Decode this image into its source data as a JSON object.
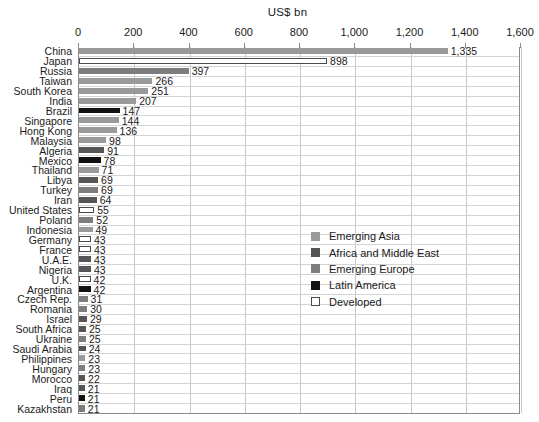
{
  "chart_data": {
    "type": "bar",
    "orientation": "horizontal",
    "title": "US$ bn",
    "xlabel": "US$ bn",
    "ylabel": "",
    "xlim": [
      0,
      1600
    ],
    "xticks": [
      0,
      200,
      400,
      600,
      800,
      1000,
      1200,
      1400,
      1600
    ],
    "xtick_labels": [
      "0",
      "200",
      "400",
      "600",
      "800",
      "1,000",
      "1,200",
      "1,400",
      "1,600"
    ],
    "grid": true,
    "legend_position": "center-right",
    "categories": [
      "China",
      "Japan",
      "Russia",
      "Taiwan",
      "South Korea",
      "India",
      "Brazil",
      "Singapore",
      "Hong Kong",
      "Malaysia",
      "Algeria",
      "Mexico",
      "Thailand",
      "Libya",
      "Turkey",
      "Iran",
      "United States",
      "Poland",
      "Indonesia",
      "Germany",
      "France",
      "U.A.E.",
      "Nigeria",
      "U.K.",
      "Argentina",
      "Czech Rep.",
      "Romania",
      "Israel",
      "South Africa",
      "Ukraine",
      "Saudi Arabia",
      "Philippines",
      "Hungary",
      "Morocco",
      "Iraq",
      "Peru",
      "Kazakhstan"
    ],
    "values": [
      1335,
      898,
      397,
      266,
      251,
      207,
      147,
      144,
      136,
      98,
      91,
      78,
      71,
      69,
      69,
      64,
      55,
      52,
      49,
      43,
      43,
      43,
      43,
      42,
      42,
      31,
      30,
      29,
      25,
      25,
      24,
      23,
      23,
      22,
      21,
      21,
      21
    ],
    "value_labels": [
      "1,335",
      "898",
      "397",
      "266",
      "251",
      "207",
      "147",
      "144",
      "136",
      "98",
      "91",
      "78",
      "71",
      "69",
      "69",
      "64",
      "55",
      "52",
      "49",
      "43",
      "43",
      "43",
      "43",
      "42",
      "42",
      "31",
      "30",
      "29",
      "25",
      "25",
      "24",
      "23",
      "23",
      "22",
      "21",
      "21",
      "21"
    ],
    "groups": [
      "Emerging Asia",
      "Developed",
      "Emerging Europe",
      "Emerging Asia",
      "Emerging Asia",
      "Emerging Asia",
      "Latin America",
      "Emerging Asia",
      "Emerging Asia",
      "Emerging Asia",
      "Africa and Middle East",
      "Latin America",
      "Emerging Asia",
      "Africa and Middle East",
      "Emerging Europe",
      "Africa and Middle East",
      "Developed",
      "Emerging Europe",
      "Emerging Asia",
      "Developed",
      "Developed",
      "Africa and Middle East",
      "Africa and Middle East",
      "Developed",
      "Latin America",
      "Emerging Europe",
      "Emerging Europe",
      "Africa and Middle East",
      "Africa and Middle East",
      "Emerging Europe",
      "Africa and Middle East",
      "Emerging Asia",
      "Emerging Europe",
      "Africa and Middle East",
      "Africa and Middle East",
      "Latin America",
      "Emerging Europe"
    ]
  },
  "legend": {
    "items": [
      {
        "label": "Emerging Asia",
        "color": "#9a9a9a"
      },
      {
        "label": "Africa and Middle East",
        "color": "#555555"
      },
      {
        "label": "Emerging Europe",
        "color": "#7d7d7d"
      },
      {
        "label": "Latin America",
        "color": "#111111"
      },
      {
        "label": "Developed",
        "color": "#ffffff"
      }
    ]
  },
  "colors": {
    "Emerging Asia": "#9a9a9a",
    "Africa and Middle East": "#555555",
    "Emerging Europe": "#7d7d7d",
    "Latin America": "#111111",
    "Developed": "#ffffff",
    "grid": "#c9c9c9",
    "axis": "#8a8a8a",
    "text": "#1a1a1a"
  }
}
